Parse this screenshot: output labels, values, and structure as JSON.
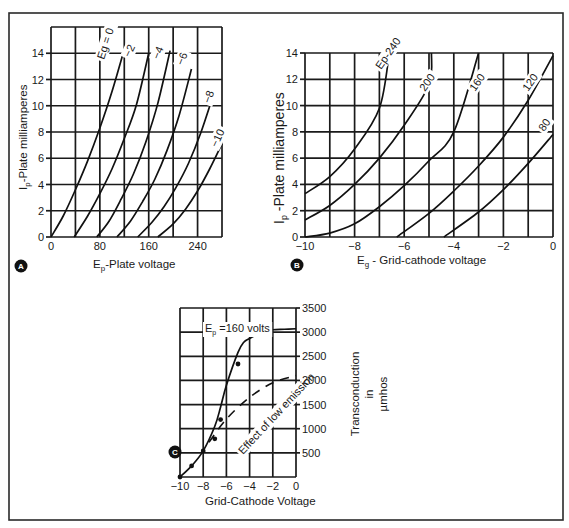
{
  "figure": {
    "panels": [
      {
        "id": "A",
        "badge": "A"
      },
      {
        "id": "B",
        "badge": "B"
      },
      {
        "id": "C",
        "badge": "C"
      }
    ]
  },
  "chart_data": [
    {
      "id": "A",
      "type": "line",
      "title": "",
      "xlabel": "Ep-Plate voltage",
      "xlabel_main": "E",
      "xlabel_sub": "p",
      "xlabel_rest": "-Plate voltage",
      "ylabel": "Ip-Plate milliamperes",
      "ylabel_main": "I",
      "ylabel_sub": "p",
      "ylabel_rest": "-Plate milliamperes",
      "xlim": [
        0,
        280
      ],
      "ylim": [
        0,
        16
      ],
      "x_ticks": [
        0,
        80,
        160,
        240
      ],
      "y_ticks": [
        0,
        2,
        4,
        6,
        8,
        10,
        12,
        14
      ],
      "x_grid_step": 40,
      "y_grid_step": 2,
      "grid": true,
      "legend": "curve labels inline",
      "series": [
        {
          "name": "Eg = 0",
          "label": "Eg = 0",
          "x": [
            0,
            20,
            40,
            60,
            80,
            100,
            120
          ],
          "y": [
            0,
            1.6,
            3.6,
            5.8,
            8.3,
            11.1,
            14.3
          ]
        },
        {
          "name": "-2",
          "label": "−2",
          "x": [
            38,
            60,
            80,
            100,
            120,
            140,
            160
          ],
          "y": [
            0,
            1.6,
            3.3,
            5.2,
            7.5,
            10.1,
            14.0
          ]
        },
        {
          "name": "-4",
          "label": "−4",
          "x": [
            75,
            95,
            115,
            135,
            155,
            175,
            195
          ],
          "y": [
            0,
            1.2,
            2.9,
            4.8,
            7.2,
            10.2,
            14.2
          ]
        },
        {
          "name": "-6",
          "label": "−6",
          "x": [
            108,
            130,
            150,
            170,
            190,
            210,
            230
          ],
          "y": [
            0,
            1.2,
            2.7,
            4.4,
            6.6,
            9.3,
            12.8
          ]
        },
        {
          "name": "-8",
          "label": "−8",
          "x": [
            142,
            165,
            185,
            205,
            225,
            245,
            265
          ],
          "y": [
            0,
            1.1,
            2.3,
            3.8,
            5.6,
            7.9,
            10.7
          ]
        },
        {
          "name": "-10",
          "label": "−10",
          "x": [
            175,
            200,
            220,
            240,
            260,
            280
          ],
          "y": [
            0,
            1.0,
            2.1,
            3.5,
            5.2,
            7.1
          ]
        }
      ]
    },
    {
      "id": "B",
      "type": "line",
      "title": "",
      "xlabel": "Eg - Grid-cathode voltage",
      "xlabel_main": "E",
      "xlabel_sub": "g",
      "xlabel_rest": " - Grid-cathode voltage",
      "ylabel": "Ip -Plate milliamperes",
      "ylabel_main": "I",
      "ylabel_sub": "p",
      "ylabel_rest": " -Plate milliamperes",
      "xlim": [
        -10,
        0
      ],
      "ylim": [
        0,
        14
      ],
      "x_ticks": [
        -10,
        -8,
        -6,
        -4,
        -2,
        0
      ],
      "x_tick_labels": [
        "−10",
        "−8",
        "−6",
        "−4",
        "−2",
        "0"
      ],
      "y_ticks": [
        0,
        2,
        4,
        6,
        8,
        10,
        12,
        14
      ],
      "x_grid_step": 1,
      "y_grid_step": 2,
      "grid": true,
      "legend": "curve labels inline",
      "series": [
        {
          "name": "Ep = 240",
          "label": "Ep-240",
          "x": [
            -10,
            -9,
            -8,
            -7,
            -6.6
          ],
          "y": [
            3.3,
            4.6,
            6.7,
            9.8,
            14.0
          ]
        },
        {
          "name": "200",
          "label": "200",
          "x": [
            -10,
            -9,
            -8,
            -7,
            -6,
            -5,
            -4.9
          ],
          "y": [
            1.3,
            2.4,
            4.0,
            6.0,
            8.5,
            11.6,
            14.0
          ]
        },
        {
          "name": "160",
          "label": "160",
          "x": [
            -10,
            -9,
            -8,
            -7,
            -6,
            -5,
            -4,
            -3
          ],
          "y": [
            0,
            0.3,
            1.0,
            2.3,
            3.9,
            5.8,
            8.0,
            14.0
          ]
        },
        {
          "name": "120",
          "label": "120",
          "x": [
            -6.3,
            -5,
            -4,
            -3,
            -2,
            -1,
            0
          ],
          "y": [
            0,
            1.8,
            3.5,
            5.4,
            7.6,
            10.4,
            13.8
          ]
        },
        {
          "name": "80",
          "label": "80",
          "x": [
            -4.4,
            -3,
            -2,
            -1,
            0
          ],
          "y": [
            0,
            1.9,
            3.6,
            5.6,
            7.8
          ]
        }
      ]
    },
    {
      "id": "C",
      "type": "line",
      "title": "",
      "xlabel": "Grid-Cathode Voltage",
      "ylabel": "Transconduction in µmhos",
      "ylabel_lines": [
        "Transconduction",
        "in",
        "µmhos"
      ],
      "xlim": [
        -10,
        0
      ],
      "ylim": [
        0,
        3500
      ],
      "x_ticks": [
        -10,
        -8,
        -6,
        -4,
        -2,
        0
      ],
      "x_tick_labels": [
        "−10",
        "−8",
        "−6",
        "−4",
        "−2",
        "0"
      ],
      "y_ticks": [
        500,
        1000,
        1500,
        2000,
        2500,
        3000,
        3500
      ],
      "y_axis_position": "right",
      "x_grid_step": 2,
      "y_grid_step": 500,
      "grid": true,
      "annotations": [
        "Ep = 160 volts",
        "Effect of low emission"
      ],
      "annotation_ep_main": "E",
      "annotation_ep_sub": "p",
      "annotation_ep_rest": " =160 volts",
      "annotation_low": "Effect of low emission",
      "series": [
        {
          "name": "Ep = 160 volts",
          "style": "solid",
          "markers": true,
          "x": [
            -10,
            -9,
            -8,
            -7,
            -6.5,
            -6,
            -5,
            -4.5,
            -4,
            -3,
            -2.5,
            -2,
            -1,
            0
          ],
          "y": [
            0,
            230,
            540,
            1050,
            1450,
            1900,
            2580,
            2790,
            2870,
            2990,
            3030,
            3050,
            3060,
            3070
          ],
          "marker_x": [
            -10,
            -9,
            -8,
            -7,
            -6.5,
            -5,
            -2.5
          ],
          "marker_y": [
            0,
            230,
            540,
            790,
            1190,
            2340,
            3020
          ]
        },
        {
          "name": "Effect of low emission",
          "style": "dashed",
          "markers": false,
          "x": [
            -7.5,
            -6,
            -4,
            -2,
            0
          ],
          "y": [
            720,
            1200,
            1650,
            1950,
            2100
          ]
        }
      ]
    }
  ]
}
